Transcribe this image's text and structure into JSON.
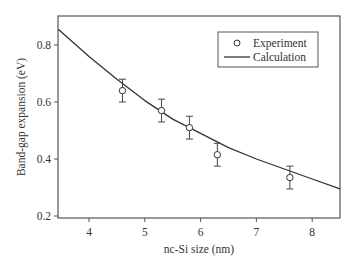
{
  "chart_data": {
    "type": "scatter",
    "title": "",
    "xlabel": "nc-Si size (nm)",
    "ylabel": "Band-gap expansion (eV)",
    "xlim": [
      3.45,
      8.5
    ],
    "ylim": [
      0.2,
      0.9
    ],
    "xticks": [
      4,
      5,
      6,
      7,
      8
    ],
    "xtick_labels": [
      "4",
      "5",
      "6",
      "7",
      "8"
    ],
    "yticks": [
      0.2,
      0.4,
      0.6,
      0.8
    ],
    "ytick_labels": [
      "0.2",
      "0.4",
      "0.6",
      "0.8"
    ],
    "grid": false,
    "legend_position": "upper right",
    "series": [
      {
        "name": "Experiment",
        "type": "scatter-errorbar",
        "marker": "open-circle",
        "x": [
          4.6,
          5.3,
          5.8,
          6.3,
          7.6
        ],
        "y": [
          0.64,
          0.57,
          0.51,
          0.415,
          0.335
        ],
        "yerr": [
          0.04,
          0.04,
          0.04,
          0.04,
          0.04
        ]
      },
      {
        "name": "Calculation",
        "type": "line",
        "x": [
          3.45,
          4.0,
          4.5,
          5.0,
          5.5,
          6.0,
          6.5,
          7.0,
          7.5,
          8.0,
          8.5
        ],
        "y": [
          0.855,
          0.76,
          0.68,
          0.605,
          0.54,
          0.49,
          0.44,
          0.4,
          0.365,
          0.33,
          0.295
        ]
      }
    ]
  },
  "legend": {
    "items": [
      {
        "label": "Experiment",
        "symbol": "open-circle"
      },
      {
        "label": "Calculation",
        "symbol": "line"
      }
    ]
  },
  "colors": {
    "axis": "#555555",
    "line": "#333333",
    "text": "#333333"
  }
}
